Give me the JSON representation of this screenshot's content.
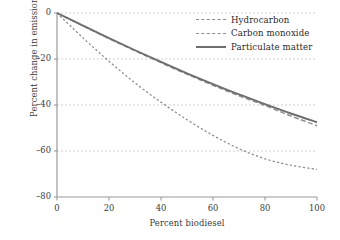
{
  "chart_data": {
    "type": "line",
    "title": "",
    "xlabel": "Percent biodiesel",
    "ylabel": "Percent change in emissions",
    "xlim": [
      0,
      100
    ],
    "ylim": [
      -80,
      0
    ],
    "xticks": [
      "0",
      "20",
      "40",
      "60",
      "80",
      "100"
    ],
    "yticks": [
      "0",
      "–20",
      "–40",
      "–60",
      "–80"
    ],
    "grid": "horizontal dashed gridlines at 0, -20, -40, -60",
    "legend_position": "top-right inside plot, no frame",
    "x": [
      0,
      10,
      20,
      30,
      40,
      50,
      60,
      70,
      80,
      90,
      100
    ],
    "series": [
      {
        "name": "Hydrocarbon",
        "style": "dotted-dashed",
        "color": "#8a8a8a",
        "values": [
          0,
          -10.8,
          -21.0,
          -30.4,
          -38.8,
          -46.4,
          -53.2,
          -59.0,
          -63.4,
          -66.2,
          -68.0
        ]
      },
      {
        "name": "Carbon monoxide",
        "style": "dashed",
        "color": "#8f8f8f",
        "values": [
          0,
          -5.6,
          -11.1,
          -16.4,
          -21.6,
          -26.6,
          -31.4,
          -36.0,
          -40.2,
          -44.8,
          -49.0
        ]
      },
      {
        "name": "Particulate matter",
        "style": "solid",
        "color": "#6e6e6e",
        "values": [
          0,
          -5.5,
          -10.9,
          -16.2,
          -21.3,
          -26.2,
          -30.9,
          -35.4,
          -39.6,
          -43.7,
          -47.5
        ]
      }
    ]
  },
  "legend": {
    "items": [
      {
        "label": "Hydrocarbon"
      },
      {
        "label": "Carbon monoxide"
      },
      {
        "label": "Particulate matter"
      }
    ]
  },
  "axes": {
    "xlabel": "Percent biodiesel",
    "ylabel": "Percent change in emissions"
  }
}
